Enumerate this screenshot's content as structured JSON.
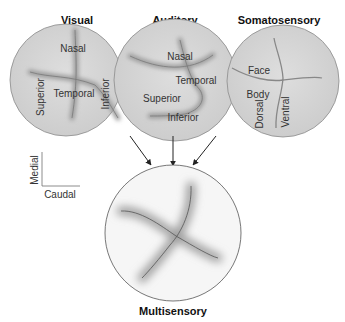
{
  "maps": {
    "visual": {
      "title": "Visual",
      "labels": {
        "top": "Nasal",
        "center": "Temporal",
        "left": "Superior",
        "right": "Inferior"
      }
    },
    "auditory": {
      "title": "Auditory",
      "labels": {
        "top": "Nasal",
        "middle": "Temporal",
        "left": "Superior",
        "bottom": "Inferior"
      }
    },
    "somatosensory": {
      "title": "Somatosensory",
      "labels": {
        "upper": "Face",
        "lower": "Body",
        "left": "Dorsal",
        "right": "Ventral"
      }
    },
    "multisensory": {
      "title": "Multisensory"
    }
  },
  "orientation": {
    "vertical": "Medial",
    "horizontal": "Caudal"
  },
  "colors": {
    "map_fill": "#d6d6d6",
    "map_stroke": "#8a8a8a",
    "axis_line": "#6e6e6e",
    "multi_fill": "#f4f4f4",
    "text": "#333333"
  }
}
